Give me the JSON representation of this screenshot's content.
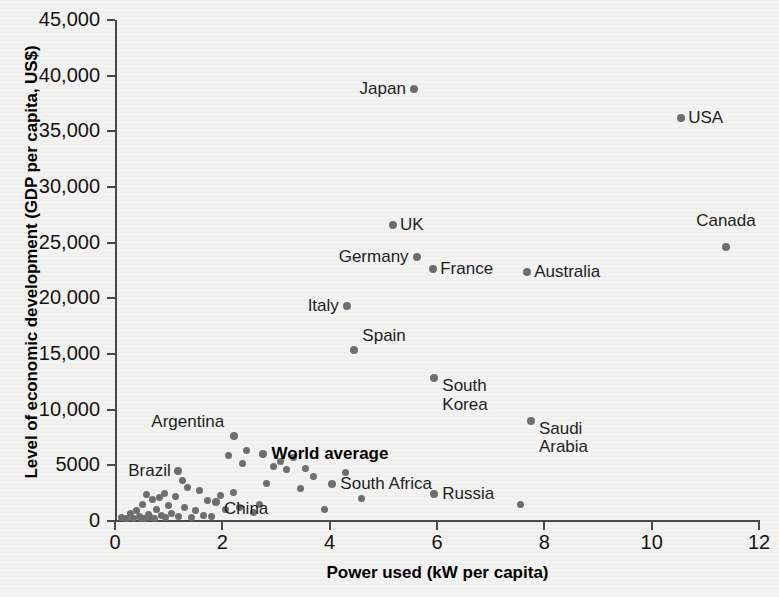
{
  "chart_data": {
    "type": "scatter",
    "title": "",
    "xlabel": "Power used (kW per capita)",
    "ylabel": "Level of economic development (GDP per capita, US$)",
    "xlim": [
      0,
      12
    ],
    "ylim": [
      0,
      45000
    ],
    "grid": false,
    "legend": "none",
    "xticks": [
      "0",
      "2",
      "4",
      "6",
      "8",
      "10",
      "12"
    ],
    "xtick_values": [
      0,
      2,
      4,
      6,
      8,
      10,
      12
    ],
    "yticks": [
      "0",
      "5000",
      "10,000",
      "15,000",
      "20,000",
      "25,000",
      "30,000",
      "35,000",
      "40,000",
      "45,000"
    ],
    "ytick_values": [
      0,
      5000,
      10000,
      15000,
      20000,
      25000,
      30000,
      35000,
      40000,
      45000
    ],
    "marker_color": "#6e6e6e",
    "axis_color": "#4a4a4a",
    "background_color": "#f2f2f0",
    "labeled_points": [
      {
        "name": "Japan",
        "x": 5.57,
        "y": 38800,
        "label": "Japan",
        "label_side": "left",
        "label_dx": -8,
        "label_dy": 0
      },
      {
        "name": "USA",
        "x": 10.55,
        "y": 36200,
        "label": "USA",
        "label_side": "right",
        "label_dx": 7,
        "label_dy": 0
      },
      {
        "name": "Canada",
        "x": 11.38,
        "y": 24600,
        "label": "Canada",
        "label_side": "left",
        "label_dx": 30,
        "label_dy": -26
      },
      {
        "name": "UK",
        "x": 5.18,
        "y": 26600,
        "label": "UK",
        "label_side": "right",
        "label_dx": 7,
        "label_dy": 0
      },
      {
        "name": "Germany",
        "x": 5.62,
        "y": 23700,
        "label": "Germany",
        "label_side": "left",
        "label_dx": -8,
        "label_dy": 0
      },
      {
        "name": "France",
        "x": 5.93,
        "y": 22600,
        "label": "France",
        "label_side": "right",
        "label_dx": 7,
        "label_dy": 0
      },
      {
        "name": "Australia",
        "x": 7.68,
        "y": 22400,
        "label": "Australia",
        "label_side": "right",
        "label_dx": 7,
        "label_dy": 0
      },
      {
        "name": "Italy",
        "x": 4.32,
        "y": 19300,
        "label": "Italy",
        "label_side": "left",
        "label_dx": -8,
        "label_dy": 0
      },
      {
        "name": "Spain",
        "x": 4.46,
        "y": 15400,
        "label": "Spain",
        "label_side": "right",
        "label_dx": 8,
        "label_dy": -14
      },
      {
        "name": "South Korea",
        "x": 5.95,
        "y": 12800,
        "label": "South\nKorea",
        "label_side": "right",
        "label_dx": 8,
        "label_dy": 8
      },
      {
        "name": "Saudi Arabia",
        "x": 7.75,
        "y": 9000,
        "label": "Saudi\nArabia",
        "label_side": "right",
        "label_dx": 8,
        "label_dy": 8
      },
      {
        "name": "Argentina",
        "x": 2.22,
        "y": 7600,
        "label": "Argentina",
        "label_side": "left",
        "label_dx": -10,
        "label_dy": -14
      },
      {
        "name": "World average",
        "x": 2.75,
        "y": 6000,
        "label": "World average",
        "label_side": "right",
        "label_dx": 9,
        "label_dy": 0,
        "bold": true
      },
      {
        "name": "Brazil",
        "x": 1.17,
        "y": 4500,
        "label": "Brazil",
        "label_side": "left",
        "label_dx": -7,
        "label_dy": 0
      },
      {
        "name": "South Africa",
        "x": 4.05,
        "y": 3300,
        "label": "South Africa",
        "label_side": "right",
        "label_dx": 8,
        "label_dy": 0
      },
      {
        "name": "Russia",
        "x": 5.95,
        "y": 2400,
        "label": "Russia",
        "label_side": "right",
        "label_dx": 8,
        "label_dy": 0
      },
      {
        "name": "China",
        "x": 1.88,
        "y": 1700,
        "label": "China",
        "label_side": "right",
        "label_dx": 8,
        "label_dy": 7
      }
    ],
    "unlabeled_points": [
      {
        "x": 0.12,
        "y": 300
      },
      {
        "x": 0.22,
        "y": 250
      },
      {
        "x": 0.28,
        "y": 700
      },
      {
        "x": 0.34,
        "y": 200
      },
      {
        "x": 0.4,
        "y": 900
      },
      {
        "x": 0.45,
        "y": 400
      },
      {
        "x": 0.5,
        "y": 250
      },
      {
        "x": 0.52,
        "y": 1500
      },
      {
        "x": 0.55,
        "y": 200
      },
      {
        "x": 0.58,
        "y": 2400
      },
      {
        "x": 0.62,
        "y": 600
      },
      {
        "x": 0.66,
        "y": 300
      },
      {
        "x": 0.7,
        "y": 1900
      },
      {
        "x": 0.74,
        "y": 250
      },
      {
        "x": 0.78,
        "y": 1000
      },
      {
        "x": 0.82,
        "y": 2100
      },
      {
        "x": 0.86,
        "y": 500
      },
      {
        "x": 0.92,
        "y": 2500
      },
      {
        "x": 0.95,
        "y": 300
      },
      {
        "x": 1.0,
        "y": 1400
      },
      {
        "x": 1.05,
        "y": 700
      },
      {
        "x": 1.12,
        "y": 2200
      },
      {
        "x": 1.18,
        "y": 400
      },
      {
        "x": 1.25,
        "y": 3600
      },
      {
        "x": 1.3,
        "y": 1200
      },
      {
        "x": 1.36,
        "y": 3000
      },
      {
        "x": 1.42,
        "y": 350
      },
      {
        "x": 1.5,
        "y": 900
      },
      {
        "x": 1.58,
        "y": 2700
      },
      {
        "x": 1.64,
        "y": 500
      },
      {
        "x": 1.72,
        "y": 1800
      },
      {
        "x": 1.8,
        "y": 400
      },
      {
        "x": 1.96,
        "y": 2300
      },
      {
        "x": 2.05,
        "y": 1000
      },
      {
        "x": 2.12,
        "y": 5900
      },
      {
        "x": 2.2,
        "y": 2600
      },
      {
        "x": 2.32,
        "y": 1200
      },
      {
        "x": 2.38,
        "y": 5200
      },
      {
        "x": 2.45,
        "y": 6300
      },
      {
        "x": 2.58,
        "y": 800
      },
      {
        "x": 2.7,
        "y": 1500
      },
      {
        "x": 2.82,
        "y": 3400
      },
      {
        "x": 2.95,
        "y": 4900
      },
      {
        "x": 3.08,
        "y": 5300
      },
      {
        "x": 3.2,
        "y": 4600
      },
      {
        "x": 3.32,
        "y": 5700
      },
      {
        "x": 3.45,
        "y": 2900
      },
      {
        "x": 3.55,
        "y": 4700
      },
      {
        "x": 3.7,
        "y": 4000
      },
      {
        "x": 3.9,
        "y": 1000
      },
      {
        "x": 4.3,
        "y": 4400
      },
      {
        "x": 4.6,
        "y": 2000
      },
      {
        "x": 7.55,
        "y": 1500
      }
    ]
  }
}
